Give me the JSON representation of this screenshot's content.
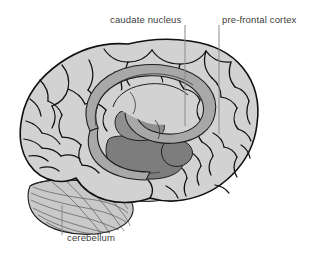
{
  "figure": {
    "background_color": "#ffffff"
  },
  "labels": {
    "caudate_nucleus": "caudate nucleus",
    "pre_frontal_cortex": "pre-frontal cortex",
    "cerebellum": "cerebellum"
  },
  "colors": {
    "cortex_fill": "#d2d2d2",
    "cortex_outline": "#1a1a1a",
    "caudate_fill": "#a8a8a8",
    "deep_structure_fill": "#7d7d7d",
    "cerebellum_fill": "#c9c9c9",
    "brainstem_fill": "#bdbdbd",
    "leader_line": "#8a8a8a",
    "label_text": "#3b3b3b"
  },
  "leader_lines": [
    {
      "name": "caudate-nucleus-leader",
      "x1": 185,
      "y1": 25,
      "x2": 185,
      "y2": 126
    },
    {
      "name": "pre-frontal-cortex-leader",
      "x1": 219,
      "y1": 25,
      "x2": 219,
      "y2": 134
    },
    {
      "name": "cerebellum-leader",
      "x1": 62,
      "y1": 205,
      "x2": 62,
      "y2": 235
    }
  ],
  "structures": [
    {
      "name": "cerebral-cortex",
      "label_visible": false
    },
    {
      "name": "caudate-nucleus",
      "label_visible": true
    },
    {
      "name": "pre-frontal-cortex",
      "label_visible": true
    },
    {
      "name": "cerebellum",
      "label_visible": true
    },
    {
      "name": "corpus-callosum",
      "label_visible": false
    },
    {
      "name": "thalamus",
      "label_visible": false
    },
    {
      "name": "brainstem",
      "label_visible": false
    }
  ]
}
